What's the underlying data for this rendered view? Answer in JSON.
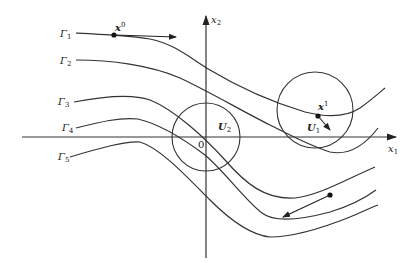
{
  "axes": {
    "x_label": "x",
    "x_sub": "1",
    "y_label": "x",
    "y_sub": "2",
    "origin_label": "0"
  },
  "curves": [
    {
      "name": "Γ",
      "sub": "1"
    },
    {
      "name": "Γ",
      "sub": "2"
    },
    {
      "name": "Γ",
      "sub": "3"
    },
    {
      "name": "Γ",
      "sub": "4"
    },
    {
      "name": "Γ",
      "sub": "5"
    }
  ],
  "points": {
    "x0": {
      "label": "x",
      "sup": "0"
    },
    "x1": {
      "label": "x",
      "sup": "1"
    }
  },
  "regions": {
    "U1": {
      "label": "U",
      "sub": "1"
    },
    "U2": {
      "label": "U",
      "sub": "2"
    }
  },
  "caption": ""
}
